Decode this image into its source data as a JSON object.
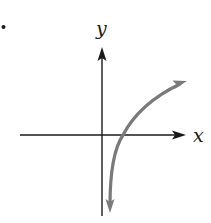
{
  "figure": {
    "bullet": "•",
    "x_axis_label": "x",
    "y_axis_label": "y"
  },
  "colors": {
    "axes": "#1a1a1a",
    "curve": "#7a7a7a",
    "background": "#ffffff"
  }
}
